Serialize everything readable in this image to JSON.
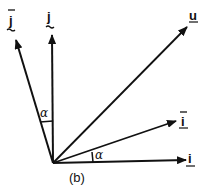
{
  "diagram": {
    "caption": "(b)",
    "origin": [
      53,
      163
    ],
    "stroke_color": "#111111",
    "vectors": [
      {
        "id": "j_bar",
        "label": "j",
        "overbar": true,
        "underbar": "tilde",
        "tip": [
          16,
          40
        ],
        "label_pos": [
          11,
          24
        ]
      },
      {
        "id": "j",
        "label": "j",
        "overbar": false,
        "underbar": "tilde",
        "tip": [
          52,
          35
        ],
        "label_pos": [
          50,
          24
        ]
      },
      {
        "id": "u",
        "label": "u",
        "overbar": false,
        "underbar": "tilde",
        "tip": [
          187,
          27
        ],
        "label_pos": [
          193,
          21
        ]
      },
      {
        "id": "i_bar",
        "label": "i",
        "overbar": true,
        "underbar": "tilde",
        "tip": [
          176,
          121
        ],
        "label_pos": [
          182,
          128
        ]
      },
      {
        "id": "i",
        "label": "i",
        "overbar": false,
        "underbar": "tilde",
        "tip": [
          186,
          160
        ],
        "label_pos": [
          191,
          165
        ]
      }
    ],
    "angles": [
      {
        "label": "α",
        "between": [
          "j",
          "j_bar"
        ],
        "label_pos": [
          40,
          117
        ]
      },
      {
        "label": "α",
        "between": [
          "i",
          "i_bar"
        ],
        "label_pos": [
          96,
          159
        ]
      }
    ]
  }
}
